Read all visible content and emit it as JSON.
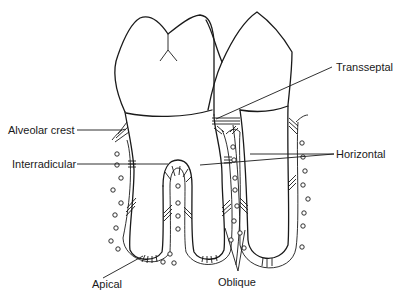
{
  "diagram": {
    "labels": {
      "alveolar_crest": "Alveolar crest",
      "interradicular": "Interradicular",
      "apical": "Apical",
      "transseptal": "Transseptal",
      "horizontal": "Horizontal",
      "oblique": "Oblique"
    },
    "teeth": [
      {
        "name": "molar",
        "roots": 2
      },
      {
        "name": "premolar",
        "roots": 1
      }
    ],
    "colors": {
      "line": "#1a1a1a",
      "background": "#ffffff"
    }
  }
}
